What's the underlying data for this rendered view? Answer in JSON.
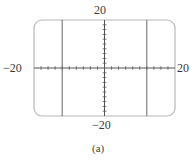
{
  "chart_data": {
    "type": "line",
    "title": "",
    "caption": "(a)",
    "xlabel": "",
    "ylabel": "",
    "xlim": [
      -20,
      20
    ],
    "ylim": [
      -20,
      20
    ],
    "tick_labels": {
      "x_min": "−20",
      "x_max": "20",
      "y_min": "−20",
      "y_max": "20"
    },
    "tick_step": 2,
    "grid": false,
    "legend": null,
    "series": [
      {
        "name": "vertical line x = -12",
        "x": [
          -12,
          -12
        ],
        "y": [
          -20,
          20
        ]
      },
      {
        "name": "vertical line x = 12",
        "x": [
          12,
          12
        ],
        "y": [
          -20,
          20
        ]
      }
    ],
    "frame": {
      "style": "rounded-rectangle",
      "color": "#b8b8b8"
    },
    "colors": {
      "axes": "#555555",
      "lines": "#666666",
      "frame": "#b8b8b8"
    }
  }
}
